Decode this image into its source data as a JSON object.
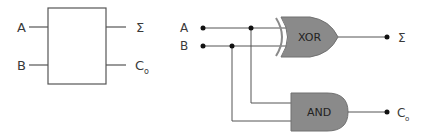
{
  "block_diagram": {
    "inputs": [
      "A",
      "B"
    ],
    "outputs": [
      "Σ",
      "C",
      "o"
    ]
  },
  "circuit": {
    "inputs": [
      "A",
      "B"
    ],
    "gates": {
      "xor": "XOR",
      "and": "AND"
    },
    "outputs": {
      "sum": "Σ",
      "carry": "C",
      "carry_sub": "o"
    }
  },
  "colors": {
    "gate_fill": "#8a8a8a",
    "line": "#555555",
    "dot": "#111111"
  }
}
